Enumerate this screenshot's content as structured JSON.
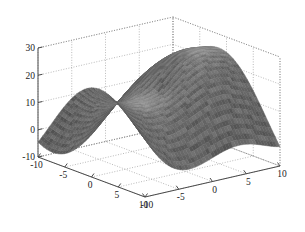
{
  "figure": {
    "type": "3d-surface-plot",
    "background": "#ffffff",
    "surface_color": "#6a6a6a",
    "axis_color": "#4a4a4a",
    "grid_color": "#8c8c8c"
  },
  "chart_data": {
    "type": "surface",
    "title": "",
    "xlabel": "",
    "ylabel": "",
    "zlabel": "",
    "grid": true,
    "legend": null,
    "xlim": [
      -10,
      10
    ],
    "ylim": [
      -10,
      10
    ],
    "zlim": [
      -10,
      30
    ],
    "xticks": [
      -10,
      -5,
      0,
      5,
      10
    ],
    "yticks": [
      -10,
      -5,
      0,
      5,
      10
    ],
    "zticks": [
      -10,
      0,
      10,
      20,
      30
    ],
    "xtick_labels": [
      "-10",
      "-5",
      "0",
      "5",
      "10"
    ],
    "ytick_labels": [
      "10",
      "5",
      "0",
      "-5",
      "-10"
    ],
    "ztick_labels": [
      "30",
      "20",
      "10",
      "0",
      "-10"
    ],
    "view_azimuth": -37.5,
    "view_elevation": 22,
    "z_range_observed": [
      -8,
      33
    ],
    "samples": 46,
    "surface_z_peak": 33,
    "surface_z_min": -8
  }
}
